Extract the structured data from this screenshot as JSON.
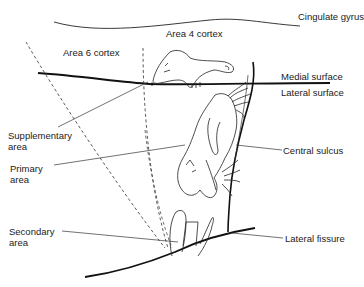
{
  "diagram": {
    "type": "anatomical-diagram",
    "labels": {
      "cingulate_gyrus": "Cingulate gyrus",
      "area4": "Area 4 cortex",
      "area6": "Area 6 cortex",
      "medial_surface": "Medial surface",
      "lateral_surface": "Lateral surface",
      "supplementary_area": "Supplementary\narea",
      "primary_area": "Primary\narea",
      "central_sulcus": "Central sulcus",
      "secondary_area": "Secondary\narea",
      "lateral_fissure": "Lateral fissure"
    },
    "colors": {
      "line": "#111111",
      "text": "#222222",
      "background": "#ffffff"
    }
  }
}
